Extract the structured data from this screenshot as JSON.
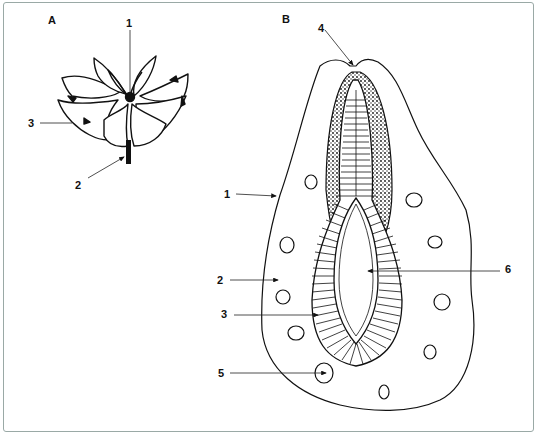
{
  "figure": {
    "panels": [
      {
        "id": "A",
        "label": "A",
        "subject": "flower (top view, petals)",
        "callouts": [
          {
            "number": "1",
            "text": "1"
          },
          {
            "number": "2",
            "text": "2"
          },
          {
            "number": "3",
            "text": "3"
          }
        ]
      },
      {
        "id": "B",
        "label": "B",
        "subject": "longitudinal section",
        "callouts": [
          {
            "number": "1",
            "text": "1"
          },
          {
            "number": "2",
            "text": "2"
          },
          {
            "number": "3",
            "text": "3"
          },
          {
            "number": "4",
            "text": "4"
          },
          {
            "number": "5",
            "text": "5"
          },
          {
            "number": "6",
            "text": "6"
          }
        ]
      }
    ],
    "colors": {
      "ink": "#111111",
      "frame": "#9aa9a6",
      "background": "#ffffff"
    }
  }
}
